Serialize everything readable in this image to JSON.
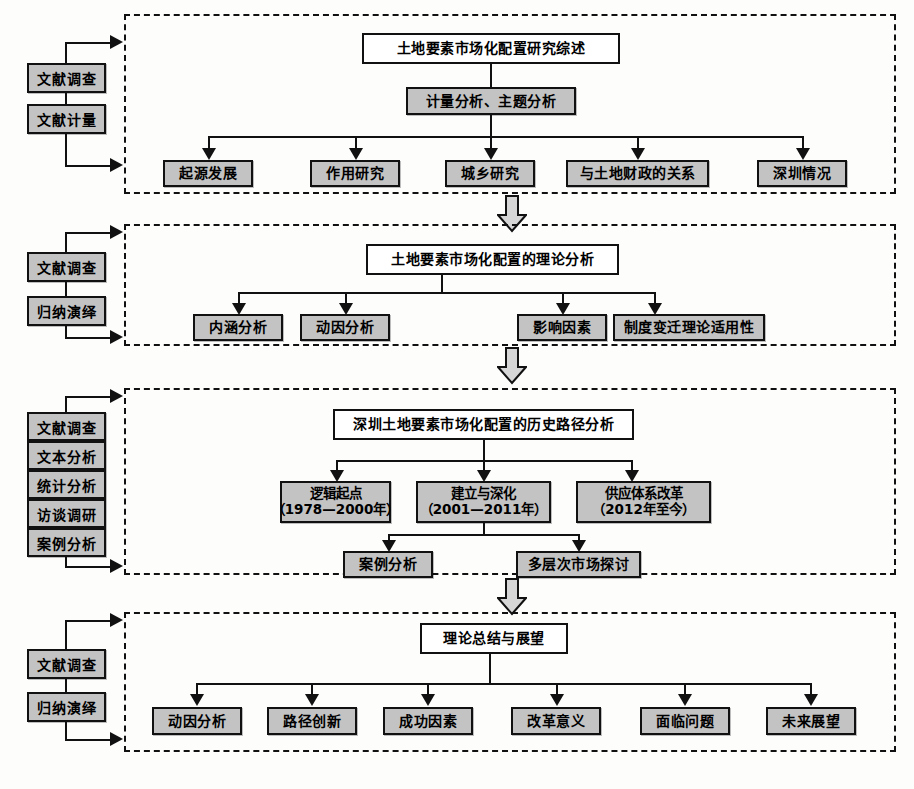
{
  "diagram": {
    "box_fill": "#c3c3c3",
    "line_color": "#111111",
    "stage_border": "dashed"
  },
  "stages": [
    {
      "id": "stage-1",
      "methods": [
        "文献调查",
        "文献计量"
      ],
      "title": "土地要素市场化配置研究综述",
      "method_node": "计量分析、主题分析",
      "leaves": [
        "起源发展",
        "作用研究",
        "城乡研究",
        "与土地财政的关系",
        "深圳情况"
      ]
    },
    {
      "id": "stage-2",
      "methods": [
        "文献调查",
        "归纳演绎"
      ],
      "title": "土地要素市场化配置的理论分析",
      "method_node": null,
      "leaves": [
        "内涵分析",
        "动因分析",
        "影响因素",
        "制度变迁理论适用性"
      ]
    },
    {
      "id": "stage-3",
      "methods": [
        "文献调查",
        "文本分析",
        "统计分析",
        "访谈调研",
        "案例分析"
      ],
      "title": "深圳土地要素市场化配置的历史路径分析",
      "method_node": null,
      "phases": [
        {
          "name": "逻辑起点",
          "period": "（1978—2000年）"
        },
        {
          "name": "建立与深化",
          "period": "（2001—2011年）"
        },
        {
          "name": "供应体系改革",
          "period": "（2012年至今）"
        }
      ],
      "sub_leaves": [
        "案例分析",
        "多层次市场探讨"
      ]
    },
    {
      "id": "stage-4",
      "methods": [
        "文献调查",
        "归纳演绎"
      ],
      "title": "理论总结与展望",
      "method_node": null,
      "leaves": [
        "动因分析",
        "路径创新",
        "成功因素",
        "改革意义",
        "面临问题",
        "未来展望"
      ]
    }
  ],
  "connectors": {
    "stage_arrow_count": 3,
    "style": "hollow-block-down-arrow"
  }
}
